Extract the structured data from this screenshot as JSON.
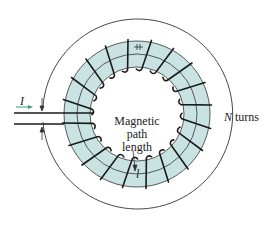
{
  "diagram": {
    "labels": {
      "current": "I",
      "path_label_line1": "Magnetic",
      "path_label_line2": "path",
      "path_label_line3": "length",
      "path_symbol": "l",
      "turns_var": "N",
      "turns_word": "turns"
    },
    "colors": {
      "core_fill": "#c9e3e3",
      "wire": "#1a1a1a",
      "outline": "#333333",
      "arrow": "#3a9a8a"
    },
    "geometry": {
      "center": [
        137,
        114
      ],
      "outer_circle_r": 95,
      "core_outer_r": 73,
      "core_inner_r": 47,
      "path_r": 60,
      "turn_count": 20
    }
  }
}
